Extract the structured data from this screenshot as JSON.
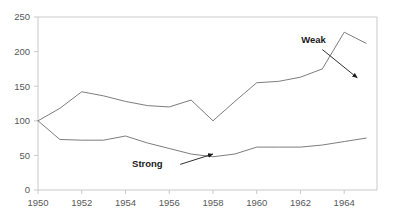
{
  "ghost_header": "···· ··",
  "chart_data": {
    "type": "line",
    "title": "",
    "subtitle": "",
    "xlabel": "",
    "ylabel": "",
    "xlim": [
      1950,
      1965.5
    ],
    "ylim": [
      0,
      250
    ],
    "grid": false,
    "legend_position": "inline-annotations",
    "x_ticks": [
      1950,
      1952,
      1954,
      1956,
      1958,
      1960,
      1962,
      1964
    ],
    "x_tick_labels": [
      "1950",
      "1952",
      "1954",
      "1956",
      "1958",
      "1960",
      "1962",
      "1964"
    ],
    "y_ticks": [
      0,
      50,
      100,
      150,
      200,
      250
    ],
    "y_tick_labels": [
      "0",
      "50",
      "100",
      "150",
      "200",
      "250"
    ],
    "x": [
      1950,
      1951,
      1952,
      1953,
      1954,
      1955,
      1956,
      1957,
      1958,
      1959,
      1960,
      1961,
      1962,
      1963,
      1964,
      1965
    ],
    "series": [
      {
        "name": "Weak",
        "color": "#6d6e71",
        "values": [
          100,
          118,
          142,
          136,
          128,
          122,
          120,
          130,
          100,
          128,
          155,
          157,
          163,
          175,
          228,
          212
        ]
      },
      {
        "name": "Strong",
        "color": "#6d6e71",
        "values": [
          100,
          73,
          72,
          72,
          78,
          68,
          60,
          52,
          48,
          52,
          62,
          62,
          62,
          65,
          70,
          75
        ]
      }
    ],
    "annotations": [
      {
        "text": "Weak",
        "label_x": 1962.6,
        "label_y": 212,
        "arrow_from_x": 1963.0,
        "arrow_from_y": 203,
        "arrow_to_x": 1964.6,
        "arrow_to_y": 162
      },
      {
        "text": "Strong",
        "label_x": 1955.0,
        "label_y": 33,
        "arrow_from_x": 1956.5,
        "arrow_from_y": 37,
        "arrow_to_x": 1958.0,
        "arrow_to_y": 52
      }
    ],
    "axis_color": "#c9c9c9",
    "line_color": "#6d6e71",
    "annotation_color": "#1a1a1a"
  }
}
